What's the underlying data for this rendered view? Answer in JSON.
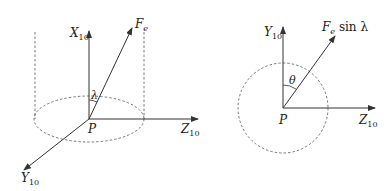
{
  "left_diagram": {
    "x_axis_label": "X",
    "x_axis_sub": "10",
    "y_axis_label": "Y",
    "y_axis_sub": "10",
    "z_axis_label": "Z",
    "z_axis_sub": "10",
    "force_label": "F",
    "force_sub": "e",
    "angle_label": "λ",
    "origin_label": "P"
  },
  "right_diagram": {
    "y_axis_label": "Y",
    "y_axis_sub": "10",
    "z_axis_label": "Z",
    "z_axis_sub": "10",
    "force_label": "F",
    "force_sub": "e",
    "force_suffix": " sin λ",
    "angle_label": "θ",
    "origin_label": "P"
  },
  "colors": {
    "line": "#333333",
    "dashed": "#555555"
  }
}
